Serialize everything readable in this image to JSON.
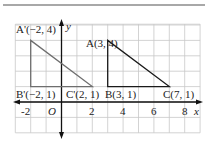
{
  "diagram": {
    "type": "coordinate-grid-translation",
    "axes": {
      "x_label": "x",
      "y_label": "y",
      "origin_label": "O",
      "x_range": [
        -3,
        9
      ],
      "y_range": [
        -2,
        5
      ],
      "x_ticks": [
        "-2",
        "2",
        "4",
        "6",
        "8"
      ]
    },
    "triangles": [
      {
        "name": "ABC",
        "color": "#1a1a1a",
        "points": [
          {
            "label": "A(3, 4)",
            "x": 3,
            "y": 4
          },
          {
            "label": "B(3, 1)",
            "x": 3,
            "y": 1
          },
          {
            "label": "C(7, 1)",
            "x": 7,
            "y": 1
          }
        ]
      },
      {
        "name": "A'B'C'",
        "color": "#6e6e6e",
        "points": [
          {
            "label": "A'(−2, 4)",
            "x": -2,
            "y": 4
          },
          {
            "label": "B'(−2, 1)",
            "x": -2,
            "y": 1
          },
          {
            "label": "C'(2, 1)",
            "x": 2,
            "y": 1
          }
        ]
      }
    ],
    "colors": {
      "grid": "#c8c8c8",
      "axis": "#111111",
      "top_rule": "#a8a8a8"
    }
  }
}
